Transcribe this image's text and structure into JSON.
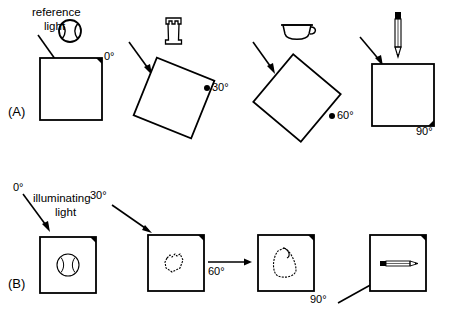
{
  "figure": {
    "title_visible": false,
    "background_color": "#ffffff",
    "stroke_color": "#000000"
  },
  "panels": [
    {
      "id": "A",
      "label": "(A)",
      "caption": "reference light",
      "caption_line1": "reference",
      "caption_line2": "light",
      "description_visible_text": "reference light",
      "light_arrows": [
        {
          "angle_label": "",
          "direction": "down-right"
        },
        {
          "angle_label": "",
          "direction": "down-right"
        },
        {
          "angle_label": "",
          "direction": "down-right"
        },
        {
          "angle_label": "",
          "direction": "down-right"
        }
      ],
      "items": [
        {
          "angle": "0°",
          "object": "baseball",
          "object_icon": "ball-icon",
          "square_rotation_deg": 0,
          "marker_corner": "top-right"
        },
        {
          "angle": "30°",
          "object": "chess rook",
          "object_icon": "rook-icon",
          "square_rotation_deg": 30,
          "marker_corner": "right"
        },
        {
          "angle": "60°",
          "object": "cup",
          "object_icon": "cup-icon",
          "square_rotation_deg": 60,
          "marker_corner": "lower-right"
        },
        {
          "angle": "90°",
          "object": "pencil",
          "object_icon": "pencil-icon",
          "square_rotation_deg": 90,
          "marker_corner": "bottom-right"
        }
      ]
    },
    {
      "id": "B",
      "label": "(B)",
      "caption": "illuminating light",
      "caption_line1": "illuminating",
      "caption_line2": "light",
      "items": [
        {
          "angle": "0°",
          "object": "baseball",
          "object_icon": "ball-icon",
          "arrow_direction": "down-right",
          "marker_corner": "top-right"
        },
        {
          "angle": "30°",
          "object": "chess rook",
          "object_icon": "rook-icon",
          "arrow_direction": "down-right",
          "marker_corner": "top-right"
        },
        {
          "angle": "60°",
          "object": "cup",
          "object_icon": "cup-icon",
          "arrow_direction": "right",
          "marker_corner": "top-right"
        },
        {
          "angle": "90°",
          "object": "pencil",
          "object_icon": "pencil-icon",
          "arrow_direction": "up-right",
          "marker_corner": "top-right"
        }
      ]
    }
  ],
  "labels": {
    "panel_a": "(A)",
    "panel_b": "(B)",
    "reference_light_line1": "reference",
    "reference_light_line2": "light",
    "illuminating_light_line1": "illuminating",
    "illuminating_light_line2": "light",
    "a_angle_0": "0°",
    "a_angle_30": "30°",
    "a_angle_60": "60°",
    "a_angle_90": "90°",
    "b_angle_0": "0°",
    "b_angle_30": "30°",
    "b_angle_60": "60°",
    "b_angle_90": "90°"
  }
}
